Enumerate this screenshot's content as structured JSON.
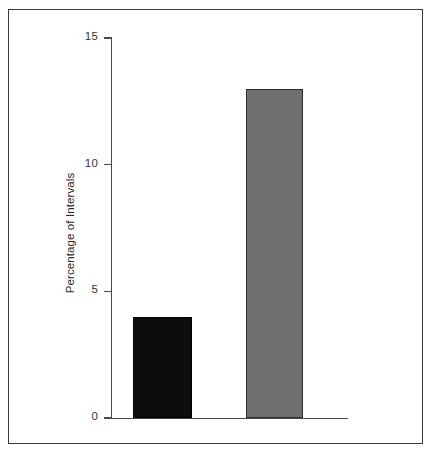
{
  "figure": {
    "background_color": "#ffffff",
    "frame_color": "#3a3a3a",
    "axis_color": "#4a4a4a"
  },
  "chart_data": {
    "type": "bar",
    "title": "",
    "subtitle": "",
    "xlabel": "",
    "ylabel": "Percentage of Intervals",
    "categories": [
      "",
      ""
    ],
    "values": [
      4,
      13
    ],
    "bar_colors": [
      "#0d0d0d",
      "#707070"
    ],
    "ylim": [
      0,
      15.5
    ],
    "yticks": [
      0,
      5,
      10,
      15
    ],
    "ytick_labels": [
      "0",
      "5",
      "10",
      "15"
    ],
    "xticks": [],
    "xtick_labels": [],
    "grid": false,
    "legend": false,
    "legend_position": "none",
    "annotations": []
  }
}
